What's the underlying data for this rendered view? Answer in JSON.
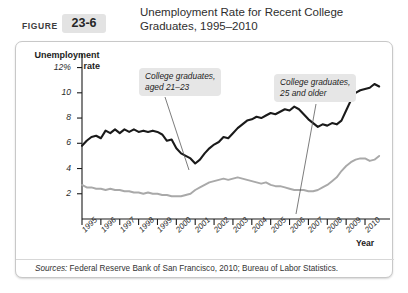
{
  "header": {
    "figure_word": "FIGURE",
    "figure_number": "23-6",
    "title_line1": "Unemployment Rate for Recent College",
    "title_line2": "Graduates, 1995–2010"
  },
  "sources": {
    "label": "Sources:",
    "text": " Federal Reserve Bank of San Francisco, 2010; Bureau of Labor Statistics."
  },
  "callouts": {
    "young_line1": "College graduates,",
    "young_line2": "aged 21–23",
    "older_line1": "College graduates,",
    "older_line2": "25 and older"
  },
  "colors": {
    "series_young": "#1a1a1a",
    "series_older": "#a9a9a9",
    "axis": "#1a1a1a",
    "callout_bg": "#e6e6e6",
    "panel_border": "#c8c8c8",
    "badge_bg": "#e3e3e3"
  },
  "chart_data": {
    "type": "line",
    "title": "Unemployment Rate for Recent College Graduates, 1995–2010",
    "xlabel": "Year",
    "ylabel": "Unemployment rate",
    "ylim": [
      0,
      12.6
    ],
    "xlim": [
      1995,
      2010.9
    ],
    "grid": false,
    "legend_position": "annotations",
    "ytick_labels": [
      "12%",
      "10",
      "8",
      "6",
      "4",
      "2"
    ],
    "ytick_values": [
      12,
      10,
      8,
      6,
      4,
      2
    ],
    "xtick_labels": [
      "1995",
      "1996",
      "1997",
      "1998",
      "1999",
      "2000",
      "2001",
      "2002",
      "2003",
      "2004",
      "2005",
      "2006",
      "2007",
      "2008",
      "2009",
      "2010"
    ],
    "xtick_values": [
      1995,
      1996,
      1997,
      1998,
      1999,
      2000,
      2001,
      2002,
      2003,
      2004,
      2005,
      2006,
      2007,
      2008,
      2009,
      2010
    ],
    "series": [
      {
        "name": "College graduates, aged 21–23",
        "color": "#1a1a1a",
        "x": [
          1995.0,
          1995.25,
          1995.5,
          1995.75,
          1996.0,
          1996.25,
          1996.5,
          1996.75,
          1997.0,
          1997.25,
          1997.5,
          1997.75,
          1998.0,
          1998.25,
          1998.5,
          1998.75,
          1999.0,
          1999.25,
          1999.5,
          1999.75,
          2000.0,
          2000.25,
          2000.5,
          2000.75,
          2001.0,
          2001.25,
          2001.5,
          2001.75,
          2002.0,
          2002.25,
          2002.5,
          2002.75,
          2003.0,
          2003.25,
          2003.5,
          2003.75,
          2004.0,
          2004.25,
          2004.5,
          2004.75,
          2005.0,
          2005.25,
          2005.5,
          2005.75,
          2006.0,
          2006.25,
          2006.5,
          2006.75,
          2007.0,
          2007.25,
          2007.5,
          2007.75,
          2008.0,
          2008.25,
          2008.5,
          2008.75,
          2009.0,
          2009.25,
          2009.5,
          2009.75,
          2010.0,
          2010.25,
          2010.5,
          2010.75
        ],
        "values": [
          5.8,
          6.2,
          6.5,
          6.6,
          6.4,
          7.0,
          6.8,
          7.1,
          6.8,
          7.1,
          6.9,
          7.1,
          6.9,
          7.0,
          6.9,
          7.0,
          6.9,
          6.7,
          6.2,
          6.3,
          5.6,
          5.2,
          5.0,
          4.8,
          4.4,
          4.7,
          5.2,
          5.6,
          5.9,
          6.1,
          6.5,
          6.4,
          6.8,
          7.2,
          7.5,
          7.8,
          7.9,
          8.1,
          8.0,
          8.2,
          8.4,
          8.3,
          8.5,
          8.7,
          8.6,
          8.9,
          8.7,
          8.3,
          7.9,
          7.6,
          7.3,
          7.5,
          7.4,
          7.6,
          7.5,
          7.8,
          8.6,
          9.4,
          10.0,
          10.2,
          10.3,
          10.4,
          10.7,
          10.5
        ]
      },
      {
        "name": "College graduates, 25 and older",
        "color": "#a9a9a9",
        "x": [
          1995.0,
          1995.25,
          1995.5,
          1995.75,
          1996.0,
          1996.25,
          1996.5,
          1996.75,
          1997.0,
          1997.25,
          1997.5,
          1997.75,
          1998.0,
          1998.25,
          1998.5,
          1998.75,
          1999.0,
          1999.25,
          1999.5,
          1999.75,
          2000.0,
          2000.25,
          2000.5,
          2000.75,
          2001.0,
          2001.25,
          2001.5,
          2001.75,
          2002.0,
          2002.25,
          2002.5,
          2002.75,
          2003.0,
          2003.25,
          2003.5,
          2003.75,
          2004.0,
          2004.25,
          2004.5,
          2004.75,
          2005.0,
          2005.25,
          2005.5,
          2005.75,
          2006.0,
          2006.25,
          2006.5,
          2006.75,
          2007.0,
          2007.25,
          2007.5,
          2007.75,
          2008.0,
          2008.25,
          2008.5,
          2008.75,
          2009.0,
          2009.25,
          2009.5,
          2009.75,
          2010.0,
          2010.25,
          2010.5,
          2010.75
        ],
        "values": [
          2.7,
          2.5,
          2.5,
          2.4,
          2.4,
          2.3,
          2.4,
          2.3,
          2.3,
          2.2,
          2.2,
          2.1,
          2.1,
          2.0,
          2.1,
          2.0,
          2.0,
          1.9,
          1.9,
          1.8,
          1.8,
          1.8,
          1.9,
          2.0,
          2.3,
          2.5,
          2.7,
          2.9,
          3.0,
          3.1,
          3.2,
          3.1,
          3.2,
          3.3,
          3.2,
          3.1,
          3.0,
          2.9,
          2.8,
          2.9,
          2.7,
          2.6,
          2.6,
          2.5,
          2.4,
          2.3,
          2.3,
          2.3,
          2.2,
          2.2,
          2.3,
          2.5,
          2.7,
          3.0,
          3.3,
          3.8,
          4.2,
          4.5,
          4.7,
          4.8,
          4.8,
          4.6,
          4.7,
          5.0
        ]
      }
    ]
  }
}
